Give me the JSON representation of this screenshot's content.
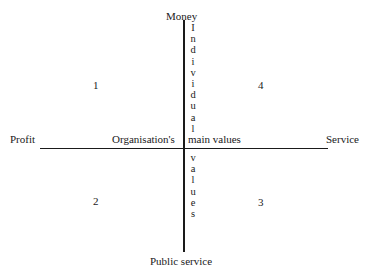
{
  "diagram": {
    "axes": {
      "top": "Money",
      "bottom": "Public service",
      "left": "Profit",
      "right": "Service"
    },
    "center_label": {
      "left": "Organisation's",
      "right": "main values"
    },
    "vertical_label_top": [
      "I",
      "n",
      "d",
      "i",
      "v",
      "i",
      "d",
      "u",
      "a",
      "l"
    ],
    "vertical_label_bottom": [
      "v",
      "a",
      "l",
      "u",
      "e",
      "s"
    ],
    "quadrants": {
      "q1": "1",
      "q2": "2",
      "q3": "3",
      "q4": "4"
    }
  }
}
